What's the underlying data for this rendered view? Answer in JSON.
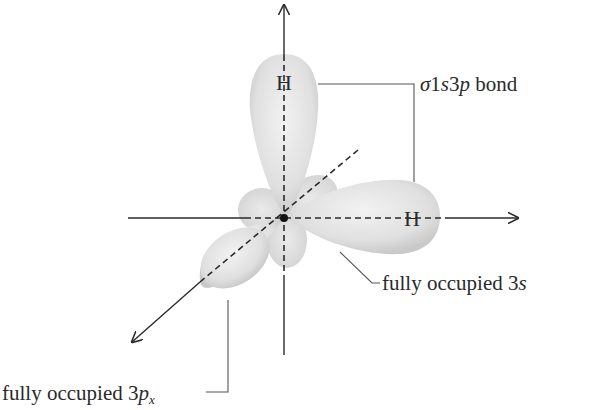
{
  "diagram": {
    "atoms": {
      "top_h": "H",
      "right_h": "H"
    },
    "labels": {
      "bond": {
        "sigma": "σ",
        "text1": "1",
        "s": "s",
        "three": "3",
        "p": "p",
        "suffix": " bond"
      },
      "s_orbital": {
        "prefix": "fully occupied 3",
        "italic": "s"
      },
      "px_orbital": {
        "prefix": "fully occupied 3",
        "italic": "p",
        "subscript": "x"
      }
    },
    "colors": {
      "lobe_fill": "#e4e4e4",
      "lobe_shade": "#c8c8c8",
      "axis": "#2a2a2a",
      "leader": "#555555"
    }
  }
}
